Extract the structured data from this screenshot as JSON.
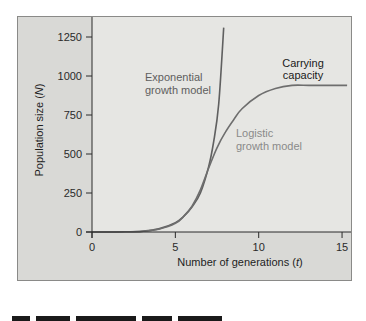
{
  "chart_data": {
    "type": "line",
    "title": "",
    "xlabel": "Number of generations (t)",
    "xlabel_main": "Number of generations (",
    "xlabel_var": "t",
    "xlabel_close": ")",
    "ylabel": "Population size (N)",
    "ylabel_main": "Population size (",
    "ylabel_var": "N",
    "ylabel_close": ")",
    "xlim": [
      0,
      15.5
    ],
    "ylim": [
      0,
      1350
    ],
    "x_ticks": [
      0,
      5,
      10,
      15
    ],
    "y_ticks": [
      0,
      250,
      500,
      750,
      1000,
      1250
    ],
    "grid": false,
    "legend": "none (curves labeled inline)",
    "series": [
      {
        "name": "Exponential growth model",
        "color": "#606060",
        "x": [
          0,
          1,
          2,
          3,
          4,
          5,
          5.5,
          6,
          6.5,
          7,
          7.3,
          7.6,
          7.9
        ],
        "values": [
          0,
          0,
          1,
          5,
          20,
          60,
          100,
          160,
          250,
          420,
          580,
          820,
          1310
        ]
      },
      {
        "name": "Logistic growth model",
        "color": "#6e6e6e",
        "x": [
          0,
          1,
          2,
          3,
          4,
          5,
          5.5,
          6,
          6.5,
          7,
          7.5,
          8,
          8.5,
          9,
          10,
          11,
          12,
          13,
          14,
          15.3
        ],
        "values": [
          0,
          0,
          1,
          4,
          18,
          55,
          100,
          165,
          270,
          410,
          540,
          640,
          720,
          790,
          875,
          920,
          940,
          940,
          940,
          940
        ]
      }
    ],
    "annotations": [
      {
        "text_lines": [
          "Exponential",
          "growth model"
        ],
        "x": 1.9,
        "y": 1010,
        "color": "#5e5e5e"
      },
      {
        "text_lines": [
          "Logistic",
          "growth model"
        ],
        "x": 8.6,
        "y": 600,
        "color": "#8a8a8a"
      },
      {
        "text_lines": [
          "Carrying",
          "capacity"
        ],
        "x": 11.5,
        "y": 1060,
        "color": "#1a1a1a"
      }
    ],
    "carrying_capacity": 940
  },
  "plot_area": {
    "panel_color": "#d9d9d6",
    "plot_bg": "#e6e6e3",
    "axis_color": "#2a2a2a"
  }
}
